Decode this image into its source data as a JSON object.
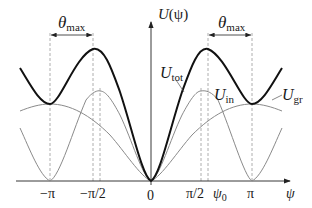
{
  "diagram": {
    "y_axis_label": "U(ψ)",
    "y_axis_label_main": "U",
    "y_axis_label_arg": "(ψ)",
    "x_axis_label": "ψ",
    "x_ticks": [
      {
        "label": "−π",
        "value": -3.14159
      },
      {
        "label": "−π/2",
        "value": -1.5708
      },
      {
        "label": "0",
        "value": 0
      },
      {
        "label": "π/2",
        "value": 1.5708
      },
      {
        "label": "ψ",
        "sub": "0",
        "value": 1.786
      },
      {
        "label": "π",
        "value": 3.14159
      }
    ],
    "curves": [
      {
        "name": "U_tot",
        "label_main": "U",
        "label_sub": "tot",
        "style": "bold",
        "color": "#111111"
      },
      {
        "name": "U_in",
        "label_main": "U",
        "label_sub": "in",
        "style": "thin",
        "color": "#888888"
      },
      {
        "name": "U_gr",
        "label_main": "U",
        "label_sub": "gr",
        "style": "thin",
        "color": "#888888"
      }
    ],
    "annotations": [
      {
        "label_main": "θ",
        "label_sub": "max",
        "from": "−π",
        "to": "−ψ0"
      },
      {
        "label_main": "θ",
        "label_sub": "max",
        "from": "ψ0",
        "to": "π"
      }
    ]
  }
}
